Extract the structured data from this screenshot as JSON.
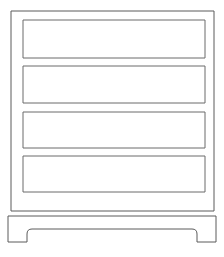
{
  "drawing": {
    "title": "Chest of Drawers",
    "style": "line-art-outline",
    "background_color": "#ffffff",
    "stroke_color": "#5a5a5a",
    "panel_stroke_color": "#6b6b6b",
    "stroke_width": 1,
    "canvas": {
      "width": 224,
      "height": 257
    },
    "carcass": {
      "label": "cabinet-body",
      "x": 11,
      "y": 11,
      "width": 203,
      "height": 200
    },
    "drawers": [
      {
        "label": "Drawer 1",
        "x": 23,
        "y": 20,
        "width": 182,
        "height": 38
      },
      {
        "label": "Drawer 2",
        "x": 23,
        "y": 66,
        "width": 182,
        "height": 37
      },
      {
        "label": "Drawer 3",
        "x": 23,
        "y": 112,
        "width": 182,
        "height": 36
      },
      {
        "label": "Drawer 4",
        "x": 23,
        "y": 156,
        "width": 182,
        "height": 36
      }
    ],
    "base": {
      "label": "plinth-base",
      "x": 8,
      "y": 216,
      "width": 208,
      "height": 26,
      "foot_left_inner_x": 27,
      "foot_right_inner_x": 197,
      "arch_top_y": 229,
      "corner_radius": 5
    }
  }
}
